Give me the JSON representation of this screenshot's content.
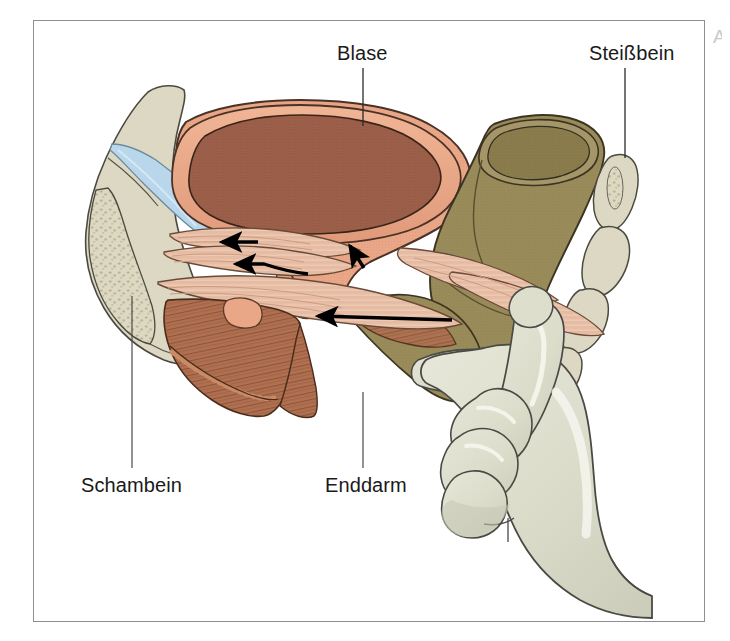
{
  "figure": {
    "type": "anatomical-illustration",
    "language": "de",
    "frame": {
      "x": 33,
      "y": 20,
      "width": 672,
      "height": 602,
      "border_color": "#8d8f92"
    },
    "background_color": "#ffffff",
    "edge_mark": "A"
  },
  "labels": [
    {
      "id": "blase",
      "text": "Blase",
      "name": "label-blase",
      "text_x": 337,
      "text_y": 42,
      "leader": {
        "x1": 363,
        "y1": 68,
        "x2": 363,
        "y2": 126
      }
    },
    {
      "id": "steissbein",
      "text": "Steißbein",
      "name": "label-steissbein",
      "text_x": 589,
      "text_y": 42,
      "leader": {
        "x1": 625,
        "y1": 68,
        "x2": 625,
        "y2": 158
      }
    },
    {
      "id": "schambein",
      "text": "Schambein",
      "name": "label-schambein",
      "text_x": 81,
      "text_y": 474,
      "leader": {
        "x1": 132,
        "y1": 296,
        "x2": 132,
        "y2": 468
      }
    },
    {
      "id": "enddarm",
      "text": "Enddarm",
      "name": "label-enddarm",
      "text_x": 325,
      "text_y": 474,
      "leader": {
        "x1": 363,
        "y1": 392,
        "x2": 363,
        "y2": 468
      }
    }
  ],
  "structures": [
    {
      "id": "bladder",
      "label": "Blase",
      "fill": "#eaa787",
      "interior_fill": "#9c5f49",
      "stroke": "#3c2a20"
    },
    {
      "id": "rectum",
      "label": "Enddarm",
      "fill": "#9a8b5b",
      "interior_fill": "#8a7b4d",
      "stroke": "#3c3420"
    },
    {
      "id": "pubic-bone",
      "label": "Schambein",
      "fill": "#ded9c4",
      "spongy_fill": "#cfc9ae",
      "stroke": "#4a4a40"
    },
    {
      "id": "coccyx",
      "label": "Steißbein",
      "fill": "#dcd8c2",
      "stroke": "#4a4a40"
    },
    {
      "id": "pelvic-floor-muscle",
      "label": "Beckenbodenmuskulatur",
      "fill": "#e8c4ad",
      "stripe": "#c99a82",
      "stroke": "#5a4336"
    },
    {
      "id": "urogenital-diaphragm",
      "label": "Diaphragma urogenitale",
      "fill": "#b07051",
      "stripe": "#8a563c",
      "stroke": "#4a2c1c"
    },
    {
      "id": "ligament",
      "label": "Band",
      "fill": "#b8d4e8",
      "stroke": "#5a7a90"
    },
    {
      "id": "hand",
      "label": "untersuchende Hand",
      "fill": "#dedecd",
      "shade": "#c5c5b4",
      "stroke": "#4a4a44"
    }
  ],
  "arrows": [
    {
      "id": "arrow-1",
      "direction": "left",
      "x": 222,
      "y": 243
    },
    {
      "id": "arrow-2",
      "direction": "left",
      "x": 232,
      "y": 265
    },
    {
      "id": "arrow-3",
      "direction": "up-left",
      "x": 352,
      "y": 246
    },
    {
      "id": "arrow-4",
      "direction": "left",
      "x": 318,
      "y": 318
    }
  ],
  "colors": {
    "bladder_outer": "#eaa787",
    "bladder_inner": "#9c5f49",
    "rectum": "#9a8b5b",
    "bone": "#ded9c4",
    "muscle_light": "#e8c4ad",
    "muscle_dark": "#b07051",
    "ligament_blue": "#b8d4e8",
    "glove": "#dedecd",
    "outline": "#33302b",
    "label_text": "#1a1a1a",
    "frame_border": "#8d8f92"
  }
}
